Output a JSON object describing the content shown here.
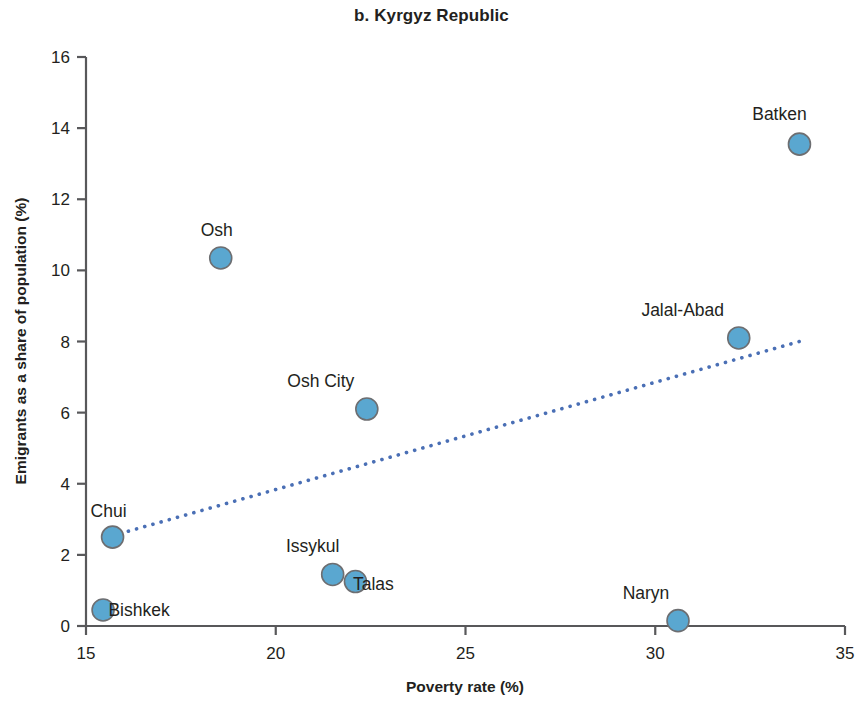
{
  "chart_data": {
    "type": "scatter",
    "title": "b. Kyrgyz Republic",
    "xlabel": "Poverty rate (%)",
    "ylabel": "Emigrants as a share of population (%)",
    "xlim": [
      15,
      35
    ],
    "ylim": [
      0,
      16
    ],
    "xticks": [
      "15",
      "20",
      "25",
      "30",
      "35"
    ],
    "yticks": [
      "0",
      "2",
      "4",
      "6",
      "8",
      "10",
      "12",
      "14",
      "16"
    ],
    "grid": false,
    "legend": "none",
    "marker_color": "#5aa7d0",
    "marker_edge_color": "#6d6e71",
    "trendline_color": "#4a6fb5",
    "points": [
      {
        "label": "Bishkek",
        "x": 15.45,
        "y": 0.45,
        "label_dx": 36,
        "label_dy": 6
      },
      {
        "label": "Chui",
        "x": 15.7,
        "y": 2.5,
        "label_dx": -4,
        "label_dy": -20
      },
      {
        "label": "Osh",
        "x": 18.55,
        "y": 10.35,
        "label_dx": -4,
        "label_dy": -22
      },
      {
        "label": "Issykul",
        "x": 21.5,
        "y": 1.45,
        "label_dx": -20,
        "label_dy": -22
      },
      {
        "label": "Talas",
        "x": 22.1,
        "y": 1.25,
        "label_dx": 18,
        "label_dy": 8
      },
      {
        "label": "Osh City",
        "x": 22.4,
        "y": 6.1,
        "label_dx": -46,
        "label_dy": -22
      },
      {
        "label": "Naryn",
        "x": 30.6,
        "y": 0.15,
        "label_dx": -32,
        "label_dy": -22
      },
      {
        "label": "Jalal-Abad",
        "x": 32.2,
        "y": 8.1,
        "label_dx": -56,
        "label_dy": -22
      },
      {
        "label": "Batken",
        "x": 33.8,
        "y": 13.55,
        "label_dx": -20,
        "label_dy": -24
      }
    ],
    "trendline": {
      "x0": 15.9,
      "y0": 2.6,
      "x1": 33.8,
      "y1": 8.0
    }
  }
}
